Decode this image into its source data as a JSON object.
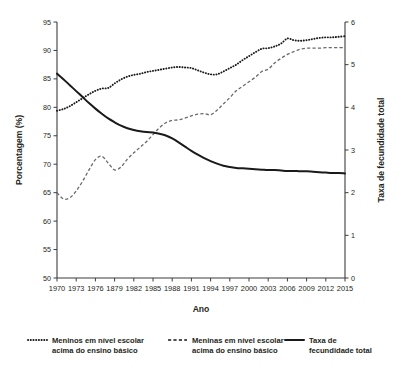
{
  "chart_data": {
    "type": "line",
    "title": "",
    "xlabel": "Ano",
    "ylabel": "Porcentagem (%)",
    "y2label": "Taxa de fecundidade total",
    "xlim": [
      1970,
      2015
    ],
    "ylim": [
      50,
      95
    ],
    "y2lim": [
      0,
      6
    ],
    "grid": false,
    "legend_position": "bottom",
    "x_tick_labels": [
      "1970",
      "1973",
      "1976",
      "1879",
      "1982",
      "1985",
      "1988",
      "1991",
      "1994",
      "1997",
      "2000",
      "2003",
      "2006",
      "2009",
      "2012",
      "2015"
    ],
    "x_tick_values": [
      1970,
      1973,
      1976,
      1979,
      1982,
      1985,
      1988,
      1991,
      1994,
      1997,
      2000,
      2003,
      2006,
      2009,
      2012,
      2015
    ],
    "y_tick_labels": [
      "50",
      "55",
      "60",
      "65",
      "70",
      "75",
      "80",
      "85",
      "90",
      "95"
    ],
    "y_tick_values": [
      50,
      55,
      60,
      65,
      70,
      75,
      80,
      85,
      90,
      95
    ],
    "y2_tick_labels": [
      "0",
      "1",
      "2",
      "3",
      "4",
      "5",
      "6"
    ],
    "y2_tick_values": [
      0,
      1,
      2,
      3,
      4,
      5,
      6
    ],
    "x": [
      1970,
      1971,
      1972,
      1973,
      1974,
      1975,
      1976,
      1977,
      1978,
      1979,
      1980,
      1981,
      1982,
      1983,
      1984,
      1985,
      1986,
      1987,
      1988,
      1989,
      1990,
      1991,
      1992,
      1993,
      1994,
      1995,
      1996,
      1997,
      1998,
      1999,
      2000,
      2001,
      2002,
      2003,
      2004,
      2005,
      2006,
      2007,
      2008,
      2009,
      2010,
      2011,
      2012,
      2013,
      2014,
      2015
    ],
    "series": [
      {
        "name": "Meninos em nível escolar acima do ensino básico",
        "axis": "left",
        "style": "dotted",
        "color": "#1a1a1a",
        "values": [
          79.4,
          79.7,
          80.2,
          80.9,
          81.6,
          82.3,
          82.9,
          83.3,
          83.4,
          84.2,
          84.9,
          85.4,
          85.7,
          85.9,
          86.2,
          86.4,
          86.6,
          86.8,
          87.0,
          87.1,
          87.0,
          86.9,
          86.5,
          86.1,
          85.8,
          85.8,
          86.3,
          86.9,
          87.5,
          88.3,
          89.0,
          89.7,
          90.3,
          90.4,
          90.7,
          91.2,
          92.1,
          91.8,
          91.7,
          91.8,
          92.0,
          92.2,
          92.3,
          92.3,
          92.4,
          92.5
        ]
      },
      {
        "name": "Meninas em nível escolar acima do ensino básico",
        "axis": "left",
        "style": "dashed",
        "color": "#6a6a6a",
        "values": [
          65.0,
          63.9,
          64.1,
          65.3,
          67.0,
          69.0,
          70.8,
          71.4,
          70.2,
          69.0,
          69.5,
          70.9,
          72.0,
          73.0,
          74.0,
          75.2,
          76.4,
          77.3,
          77.7,
          77.8,
          78.1,
          78.5,
          78.8,
          78.9,
          78.7,
          79.5,
          80.6,
          81.7,
          82.9,
          83.7,
          84.5,
          85.3,
          86.3,
          86.7,
          87.8,
          88.6,
          89.3,
          89.8,
          90.2,
          90.4,
          90.4,
          90.4,
          90.5,
          90.5,
          90.5,
          90.5
        ]
      },
      {
        "name": "Taxa de fecundidade total",
        "axis": "right",
        "style": "solid",
        "color": "#1a1a1a",
        "values": [
          4.79,
          4.66,
          4.52,
          4.38,
          4.24,
          4.1,
          3.97,
          3.85,
          3.74,
          3.65,
          3.57,
          3.51,
          3.47,
          3.44,
          3.42,
          3.41,
          3.38,
          3.34,
          3.27,
          3.18,
          3.08,
          2.98,
          2.89,
          2.81,
          2.74,
          2.68,
          2.63,
          2.6,
          2.58,
          2.57,
          2.56,
          2.55,
          2.54,
          2.53,
          2.53,
          2.52,
          2.51,
          2.51,
          2.5,
          2.5,
          2.49,
          2.48,
          2.47,
          2.46,
          2.46,
          2.45
        ]
      }
    ]
  },
  "legend": {
    "entries": [
      {
        "label_line1": "Meninos em nível escolar",
        "label_line2": "acima do ensino básico",
        "style": "dotted"
      },
      {
        "label_line1": "Meninas em nível escolar",
        "label_line2": "acima do ensino básico",
        "style": "dashed"
      },
      {
        "label_line1": "Taxa de",
        "label_line2": "fecundidade total",
        "style": "solid"
      }
    ]
  }
}
